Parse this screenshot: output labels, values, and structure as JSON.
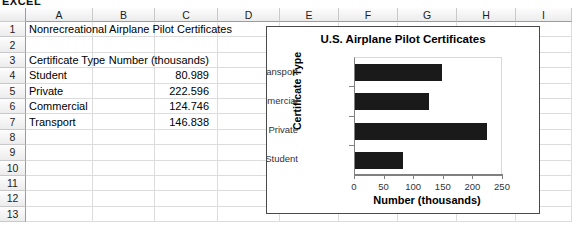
{
  "caption": "EXCEL",
  "sheet": {
    "column_headers": [
      "A",
      "B",
      "C",
      "D",
      "E",
      "F",
      "G",
      "H",
      "I"
    ],
    "row_numbers": [
      "1",
      "2",
      "3",
      "4",
      "5",
      "6",
      "7",
      "8",
      "9",
      "10",
      "11",
      "12",
      "13"
    ],
    "cells": {
      "a1": "Nonrecreational Airplane Pilot Certificates",
      "a3": "Certificate Type",
      "c3": "Number (thousands)",
      "a4": "Student",
      "c4": "80.989",
      "a5": "Private",
      "c5": "222.596",
      "a6": "Commercial",
      "c6": "124.746",
      "a7": "Transport",
      "c7": "146.838"
    }
  },
  "chart_data": {
    "type": "bar",
    "orientation": "horizontal",
    "title": "U.S. Airplane Pilot Certificates",
    "xlabel": "Number (thousands)",
    "ylabel": "Certificate Type",
    "categories": [
      "Student",
      "Private",
      "Commercial",
      "Transport"
    ],
    "values": [
      80.989,
      222.596,
      124.746,
      146.838
    ],
    "xlim": [
      0,
      250
    ],
    "xticks": [
      0,
      50,
      100,
      150,
      200,
      250
    ],
    "xtick_labels": [
      "0",
      "50",
      "100",
      "150",
      "200",
      "250"
    ],
    "grid": false,
    "legend": false,
    "bar_color": "#1a1a1a",
    "category_order_top_to_bottom": [
      "Transport",
      "Commercial",
      "Private",
      "Student"
    ]
  }
}
